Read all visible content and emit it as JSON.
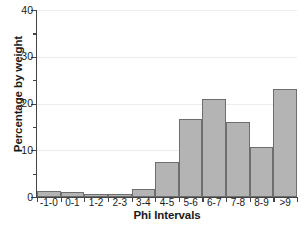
{
  "chart_data": {
    "type": "bar",
    "title": "",
    "subtitle": "",
    "xlabel": "Phi Intervals",
    "ylabel": "Percentage by weight",
    "categories": [
      "-1-0",
      "0-1",
      "1-2",
      "2-3",
      "3-4",
      "4-5",
      "5-6",
      "6-7",
      "7-8",
      "8-9",
      ">9"
    ],
    "values": [
      1.2,
      1.1,
      0.6,
      0.6,
      1.7,
      7.5,
      16.7,
      21.0,
      16.0,
      10.7,
      23.0
    ],
    "ylim": [
      0,
      40
    ],
    "ytick_labels": [
      "0",
      "10",
      "20",
      "30",
      "40"
    ],
    "ytick_values": [
      0,
      10,
      20,
      30,
      40
    ],
    "yminor_values": [
      5,
      15,
      25,
      35
    ],
    "grid": true,
    "grid_axis": "y",
    "legend": false,
    "legend_position": "none",
    "bar_fill_color": "#b4b4b4",
    "bar_edge_color": "#6e6e6e",
    "axis_color": "#444444",
    "grid_color": "#ececec",
    "text_color": "#1a1a1a"
  }
}
